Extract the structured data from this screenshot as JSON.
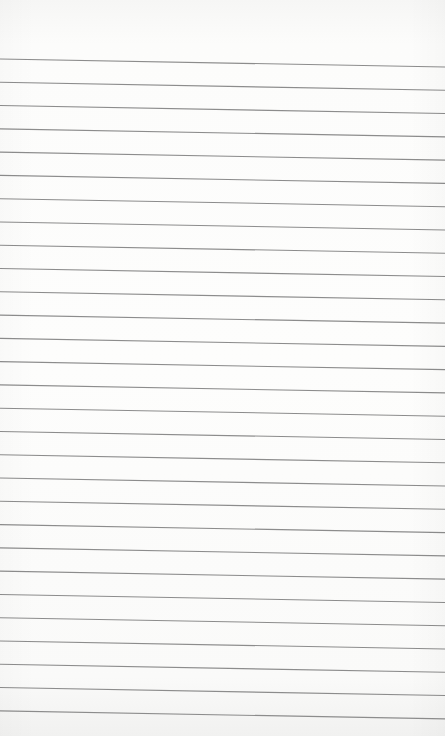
{
  "paper": {
    "type": "ruled notebook page",
    "background_color": "#fcfcfb",
    "line_color": "#8c8c8c",
    "line_count": 29,
    "first_line_left_y": 59,
    "first_line_right_y": 67,
    "line_spacing": 23.28
  }
}
